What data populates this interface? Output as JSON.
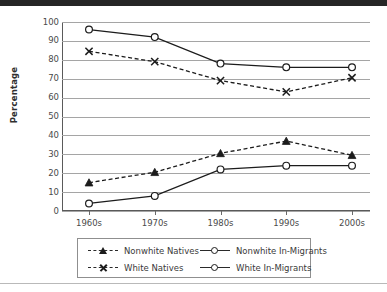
{
  "figure": {
    "ylabel": "Percentage"
  },
  "chart_data": {
    "type": "line",
    "title": "",
    "xlabel": "",
    "ylabel": "Percentage",
    "categories": [
      "1960s",
      "1970s",
      "1980s",
      "1990s",
      "2000s"
    ],
    "yticks": [
      0,
      10,
      20,
      30,
      40,
      50,
      60,
      70,
      80,
      90,
      100
    ],
    "ylim": [
      0,
      100
    ],
    "grid": true,
    "legend_position": "bottom",
    "series": [
      {
        "name": "Nonwhite Natives",
        "marker": "triangle",
        "line": "dashed",
        "color": "#1c1c1c",
        "values": [
          15,
          20.5,
          30.5,
          37,
          29.5
        ]
      },
      {
        "name": "White Natives",
        "marker": "x",
        "line": "dashed",
        "color": "#1c1c1c",
        "values": [
          84.5,
          79,
          69,
          63,
          70.5
        ]
      },
      {
        "name": "Nonwhite In-Migrants",
        "marker": "circle",
        "line": "solid",
        "color": "#1c1c1c",
        "values": [
          96,
          92,
          78,
          76,
          76
        ]
      },
      {
        "name": "White In-Migrants",
        "marker": "circle",
        "line": "solid",
        "color": "#1c1c1c",
        "values": [
          4,
          8,
          22,
          24,
          24
        ]
      }
    ]
  },
  "legend": {
    "entries": [
      {
        "label": "Nonwhite Natives",
        "marker": "triangle",
        "line": "dashed"
      },
      {
        "label": "Nonwhite In-Migrants",
        "marker": "circle",
        "line": "solid"
      },
      {
        "label": "White Natives",
        "marker": "x",
        "line": "dashed"
      },
      {
        "label": "White In-Migrants",
        "marker": "circle",
        "line": "solid"
      }
    ]
  }
}
